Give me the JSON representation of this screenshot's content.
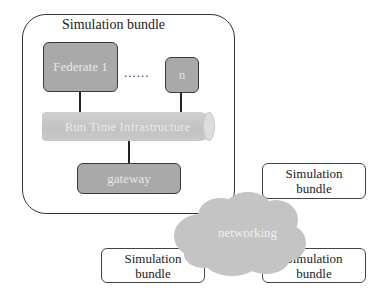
{
  "diagram": {
    "main_bundle": {
      "title": "Simulation bundle",
      "federate_1": "Federate 1",
      "ellipsis": "......",
      "federate_n": "n",
      "rti": "Run Time Infrastructure",
      "gateway": "gateway"
    },
    "network": {
      "label": "networking"
    },
    "remote_bundles": [
      {
        "line1": "Simulation",
        "line2": "bundle"
      },
      {
        "line1": "Simulation",
        "line2": "bundle"
      },
      {
        "line1": "Simulation",
        "line2": "bundle"
      }
    ],
    "colors": {
      "box_fill": "#a9a9a9",
      "rti_fill": "#c8c8c8",
      "cloud_fill": "#c4c4c4",
      "stroke": "#333333"
    }
  }
}
